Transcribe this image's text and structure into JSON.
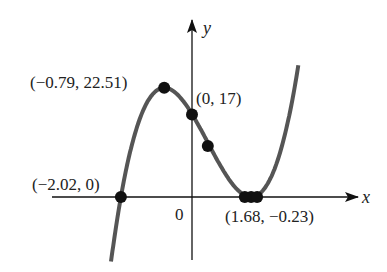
{
  "chart_data": {
    "type": "line",
    "title": "",
    "xlabel": "x",
    "ylabel": "y",
    "origin_label": "0",
    "function_approx": "y = 3(x + 2.02)(x - 1.68)^2",
    "xlim": [
      -3.9,
      4.7
    ],
    "ylim": [
      -13,
      36
    ],
    "grid": false,
    "legend": null,
    "curve_color": "#555555",
    "point_color": "#111111",
    "labeled_points": [
      {
        "x": -2.02,
        "y": 0,
        "label": "(−2.02, 0)"
      },
      {
        "x": -0.79,
        "y": 22.51,
        "label": "(−0.79, 22.51)"
      },
      {
        "x": 0,
        "y": 17,
        "label": "(0, 17)"
      },
      {
        "x": 1.68,
        "y": -0.23,
        "label": "(1.68, −0.23)"
      }
    ],
    "unlabeled_points": [
      {
        "x": 0.45,
        "y": 10.5
      },
      {
        "x": 1.5,
        "y": 0
      },
      {
        "x": 1.85,
        "y": 0
      }
    ]
  },
  "labels": {
    "x_axis": "x",
    "y_axis": "y",
    "origin": "0",
    "p_root": "(−2.02, 0)",
    "p_max": "(−0.79, 22.51)",
    "p_yint": "(0, 17)",
    "p_min": "(1.68, −0.23)"
  }
}
